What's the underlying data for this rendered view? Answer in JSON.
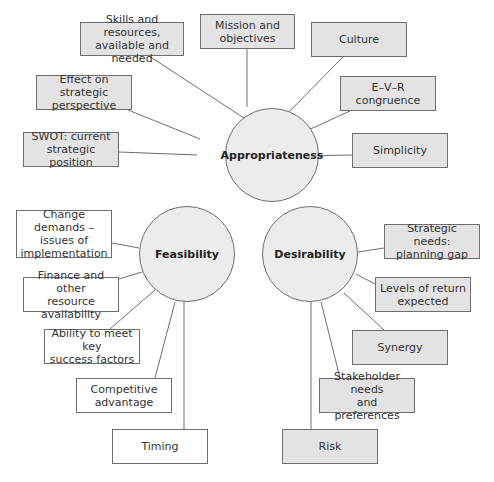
{
  "colors": {
    "box_gray": "#e3e3e3",
    "box_white": "#ffffff",
    "hub_fill": "#ececec",
    "line": "#6e6e6e"
  },
  "hubs": [
    {
      "id": "appropriateness",
      "label": "Appropriateness",
      "cx": 272,
      "cy": 155,
      "r": 47
    },
    {
      "id": "feasibility",
      "label": "Feasibility",
      "cx": 187,
      "cy": 254,
      "r": 48
    },
    {
      "id": "desirability",
      "label": "Desirability",
      "cx": 310,
      "cy": 254,
      "r": 48
    }
  ],
  "nodes": [
    {
      "hub": "appropriateness",
      "label": "Skills and resources,\navailable and needed",
      "x": 80,
      "y": 22,
      "w": 104,
      "h": 34,
      "fill": "gray",
      "ax": 149,
      "ay": 56,
      "bx": 244,
      "by": 118
    },
    {
      "hub": "appropriateness",
      "label": "Mission and\nobjectives",
      "x": 200,
      "y": 14,
      "w": 95,
      "h": 35,
      "fill": "gray",
      "ax": 247,
      "ay": 49,
      "bx": 247,
      "by": 107
    },
    {
      "hub": "appropriateness",
      "label": "Culture",
      "x": 311,
      "y": 22,
      "w": 96,
      "h": 35,
      "fill": "gray",
      "ax": 343,
      "ay": 57,
      "bx": 281,
      "by": 120
    },
    {
      "hub": "appropriateness",
      "label": "E–V–R\ncongruence",
      "x": 340,
      "y": 76,
      "w": 96,
      "h": 35,
      "fill": "gray",
      "ax": 350,
      "ay": 111,
      "bx": 293,
      "by": 137
    },
    {
      "hub": "appropriateness",
      "label": "Simplicity",
      "x": 352,
      "y": 133,
      "w": 96,
      "h": 35,
      "fill": "gray",
      "ax": 352,
      "ay": 155,
      "bx": 296,
      "by": 156
    },
    {
      "hub": "appropriateness",
      "label": "Effect on strategic\nperspective",
      "x": 36,
      "y": 75,
      "w": 96,
      "h": 35,
      "fill": "gray",
      "ax": 128,
      "ay": 110,
      "bx": 200,
      "by": 139
    },
    {
      "hub": "appropriateness",
      "label": "SWOT: current\nstrategic position",
      "x": 23,
      "y": 132,
      "w": 96,
      "h": 35,
      "fill": "gray",
      "ax": 119,
      "ay": 152,
      "bx": 197,
      "by": 155
    },
    {
      "hub": "feasibility",
      "label": "Change demands –\nissues of\nimplementation",
      "x": 16,
      "y": 210,
      "w": 96,
      "h": 48,
      "fill": "white",
      "ax": 112,
      "ay": 243,
      "bx": 139,
      "by": 248
    },
    {
      "hub": "feasibility",
      "label": "Finance and other\nresource availability",
      "x": 23,
      "y": 277,
      "w": 96,
      "h": 35,
      "fill": "white",
      "ax": 119,
      "ay": 279,
      "bx": 142,
      "by": 272
    },
    {
      "hub": "feasibility",
      "label": "Ability to meet key\nsuccess factors",
      "x": 44,
      "y": 329,
      "w": 96,
      "h": 35,
      "fill": "white",
      "ax": 110,
      "ay": 329,
      "bx": 155,
      "by": 290
    },
    {
      "hub": "feasibility",
      "label": "Competitive\nadvantage",
      "x": 76,
      "y": 378,
      "w": 96,
      "h": 35,
      "fill": "white",
      "ax": 155,
      "ay": 378,
      "bx": 175,
      "by": 302
    },
    {
      "hub": "feasibility",
      "label": "Timing",
      "x": 112,
      "y": 429,
      "w": 96,
      "h": 35,
      "fill": "white",
      "ax": 184,
      "ay": 429,
      "bx": 184,
      "by": 302
    },
    {
      "hub": "desirability",
      "label": "Strategic needs:\nplanning gap",
      "x": 384,
      "y": 224,
      "w": 96,
      "h": 35,
      "fill": "gray",
      "ax": 384,
      "ay": 248,
      "bx": 358,
      "by": 252
    },
    {
      "hub": "desirability",
      "label": "Levels of return\nexpected",
      "x": 375,
      "y": 277,
      "w": 96,
      "h": 35,
      "fill": "gray",
      "ax": 375,
      "ay": 284,
      "bx": 356,
      "by": 274
    },
    {
      "hub": "desirability",
      "label": "Synergy",
      "x": 352,
      "y": 330,
      "w": 96,
      "h": 35,
      "fill": "gray",
      "ax": 384,
      "ay": 330,
      "bx": 344,
      "by": 293
    },
    {
      "hub": "desirability",
      "label": "Stakeholder needs\nand preferences",
      "x": 319,
      "y": 378,
      "w": 96,
      "h": 35,
      "fill": "gray",
      "ax": 340,
      "ay": 378,
      "bx": 321,
      "by": 302
    },
    {
      "hub": "desirability",
      "label": "Risk",
      "x": 282,
      "y": 429,
      "w": 96,
      "h": 35,
      "fill": "gray",
      "ax": 311,
      "ay": 429,
      "bx": 311,
      "by": 302
    }
  ]
}
